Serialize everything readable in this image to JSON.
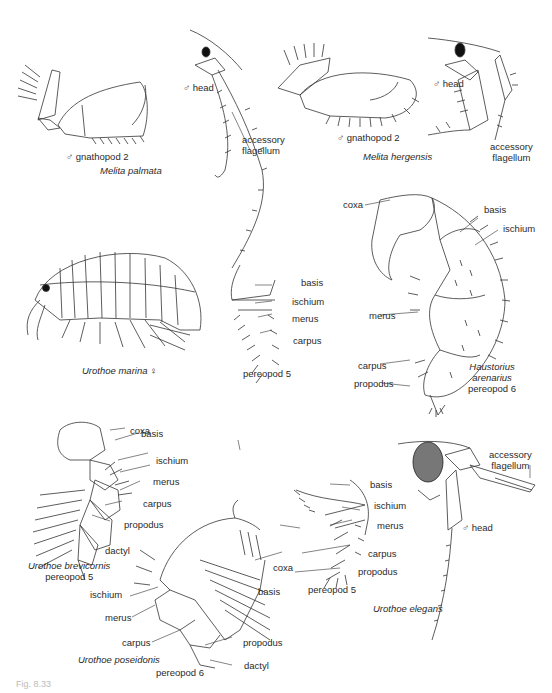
{
  "figure": {
    "caption": "Fig. 8.33",
    "panels": [
      {
        "species": "Melita palmata",
        "labels": [
          "♂ gnathopod 2",
          "♂ head",
          "accessory flagellum"
        ]
      },
      {
        "species": "Melita hergensis",
        "labels": [
          "♂ gnathopod 2",
          "♂ head",
          "accessory flagellum"
        ]
      },
      {
        "species": "Urothoe marina ♀",
        "labels": []
      },
      {
        "species": "",
        "structure": "pereopod 5",
        "labels": [
          "basis",
          "ischium",
          "merus",
          "carpus"
        ]
      },
      {
        "species": "Haustorius arenarius",
        "structure": "pereopod 6",
        "labels": [
          "coxa",
          "basis",
          "ischium",
          "merus",
          "carpus",
          "propodus"
        ]
      },
      {
        "species": "Urothoe brevicornis",
        "structure": "pereopod 5",
        "labels": [
          "coxa",
          "basis",
          "ischium",
          "merus",
          "carpus",
          "propodus",
          "dactyl"
        ]
      },
      {
        "species": "Urothoe poseidonis",
        "structure": "pereopod 6",
        "labels": [
          "coxa",
          "basis",
          "ischium",
          "merus",
          "carpus",
          "propodus",
          "dactyl"
        ]
      },
      {
        "species": "Urothoe elegans",
        "structure": "pereopod 5",
        "labels": [
          "basis",
          "ischium",
          "merus",
          "carpus",
          "propodus",
          "♂ head",
          "accessory flagellum"
        ]
      }
    ]
  },
  "text": {
    "mp_gnath": "♂ gnathopod 2",
    "mp_species": "Melita palmata",
    "mp_head": "♂ head",
    "mp_acc1": "accessory",
    "mp_acc2": "flagellum",
    "mh_gnath": "♂ gnathopod 2",
    "mh_species": "Melita hergensis",
    "mh_head": "♂ head",
    "mh_acc1": "accessory",
    "mh_acc2": "flagellum",
    "um_species": "Urothoe marina ♀",
    "p5_basis": "basis",
    "p5_ischium": "ischium",
    "p5_merus": "merus",
    "p5_carpus": "carpus",
    "p5_title": "pereopod 5",
    "ha_coxa": "coxa",
    "ha_basis": "basis",
    "ha_ischium": "ischium",
    "ha_merus": "merus",
    "ha_carpus": "carpus",
    "ha_propodus": "propodus",
    "ha_sp1": "Haustorius",
    "ha_sp2": "arenarius",
    "ha_sp3": "pereopod 6",
    "ub_coxa": "coxa",
    "ub_basis": "basis",
    "ub_ischium": "ischium",
    "ub_merus": "merus",
    "ub_carpus": "carpus",
    "ub_propodus": "propodus",
    "ub_dactyl": "dactyl",
    "ub_sp1": "Urothoe brevicornis",
    "ub_sp2": "pereopod 5",
    "up_coxa": "coxa",
    "up_basis": "basis",
    "up_ischium": "ischium",
    "up_merus": "merus",
    "up_carpus": "carpus",
    "up_propodus": "propodus",
    "up_dactyl": "dactyl",
    "up_species": "Urothoe poseidonis",
    "up_pereo": "pereopod 6",
    "ue_basis": "basis",
    "ue_ischium": "ischium",
    "ue_merus": "merus",
    "ue_carpus": "carpus",
    "ue_propodus": "propodus",
    "ue_pereo": "pereopod 5",
    "ue_head": "♂ head",
    "ue_acc1": "accessory",
    "ue_acc2": "flagellum",
    "ue_species": "Urothoe elegans"
  }
}
